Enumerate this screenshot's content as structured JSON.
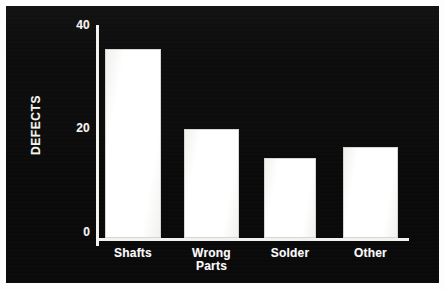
{
  "chart_data": {
    "type": "bar",
    "title": "",
    "subtitle": "",
    "xlabel": "",
    "ylabel": "DEFECTS",
    "categories": [
      "Shafts",
      "Wrong Parts",
      "Solder",
      "Other"
    ],
    "values": [
      35.5,
      20.5,
      15,
      17
    ],
    "series": [
      {
        "name": "Defects",
        "values": [
          35.5,
          20.5,
          15,
          17
        ]
      }
    ],
    "ylim": [
      0,
      40
    ],
    "ytick_labels": [
      "0",
      "20",
      "40"
    ],
    "ytick_values": [
      0,
      20,
      40
    ],
    "grid": false,
    "legend": false,
    "legend_position": "none",
    "bar_color": "#ffffff",
    "background_color": "#0a0a0a",
    "axis_color": "#f2f2ef",
    "text_color": "#f4f4f1"
  },
  "axis": {
    "y_title": "DEFECTS",
    "ticks": [
      {
        "label": "40",
        "value": 40
      },
      {
        "label": "20",
        "value": 20
      },
      {
        "label": "0",
        "value": 0
      }
    ]
  },
  "bars": [
    {
      "label": "Shafts",
      "label_line1": "Shafts",
      "label_line2": "",
      "value": 35.5
    },
    {
      "label": "Wrong Parts",
      "label_line1": "Wrong",
      "label_line2": "Parts",
      "value": 20.5
    },
    {
      "label": "Solder",
      "label_line1": "Solder",
      "label_line2": "",
      "value": 15
    },
    {
      "label": "Other",
      "label_line1": "Other",
      "label_line2": "",
      "value": 17
    }
  ]
}
